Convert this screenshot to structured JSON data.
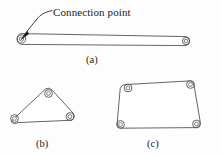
{
  "figure": {
    "width": 222,
    "height": 156,
    "background_color": "#fdfdfd",
    "stroke_color": "#3a3a3a",
    "text_color": "#1a1a1a",
    "annotation": {
      "text": "Connection point",
      "leader": "curved leader line with arrowhead pointing to the left joint of link (a)"
    },
    "sub_labels": {
      "a": "(a)",
      "b": "(b)",
      "c": "(c)"
    },
    "links": [
      {
        "id": "a",
        "label": "(a)",
        "kind": "binary-link",
        "joint_count": 2,
        "joints": [
          {
            "cx": 21.5,
            "cy": 39.0,
            "r_outer": 4.2,
            "r_inner": 2.1
          },
          {
            "cx": 186.0,
            "cy": 41.0,
            "r_outer": 3.6,
            "r_inner": 1.8
          }
        ]
      },
      {
        "id": "b",
        "label": "(b)",
        "kind": "ternary-link",
        "joint_count": 3,
        "joints": [
          {
            "cx": 14.5,
            "cy": 118.5,
            "r_outer": 3.9,
            "r_inner": 1.9
          },
          {
            "cx": 48.5,
            "cy": 93.5,
            "r_outer": 3.9,
            "r_inner": 1.9
          },
          {
            "cx": 70.0,
            "cy": 116.5,
            "r_outer": 3.9,
            "r_inner": 1.9
          }
        ]
      },
      {
        "id": "c",
        "label": "(c)",
        "kind": "quaternary-link",
        "joint_count": 4,
        "joints": [
          {
            "cx": 128.0,
            "cy": 88.0,
            "r_outer": 3.9,
            "r_inner": 1.9
          },
          {
            "cx": 190.5,
            "cy": 84.5,
            "r_outer": 3.9,
            "r_inner": 1.9
          },
          {
            "cx": 196.5,
            "cy": 124.0,
            "r_outer": 3.9,
            "r_inner": 1.9
          },
          {
            "cx": 120.5,
            "cy": 124.5,
            "r_outer": 3.9,
            "r_inner": 1.9
          }
        ]
      }
    ]
  }
}
